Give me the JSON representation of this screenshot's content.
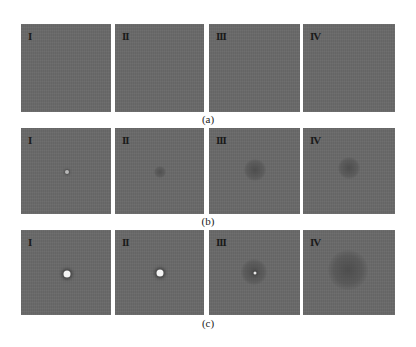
{
  "figure": {
    "rows": [
      {
        "caption": "(a)",
        "panels": [
          {
            "label": "I",
            "feature": "none"
          },
          {
            "label": "II",
            "feature": "none"
          },
          {
            "label": "III",
            "feature": "none"
          },
          {
            "label": "IV",
            "feature": "none"
          }
        ]
      },
      {
        "caption": "(b)",
        "panels": [
          {
            "label": "I",
            "feature": "small-spot"
          },
          {
            "label": "II",
            "feature": "small-cloud"
          },
          {
            "label": "III",
            "feature": "medium-cloud"
          },
          {
            "label": "IV",
            "feature": "medium-cloud"
          }
        ]
      },
      {
        "caption": "(c)",
        "panels": [
          {
            "label": "I",
            "feature": "bright-spot"
          },
          {
            "label": "II",
            "feature": "bright-spot"
          },
          {
            "label": "III",
            "feature": "cloud-with-bright-core"
          },
          {
            "label": "IV",
            "feature": "large-cloud"
          }
        ]
      }
    ],
    "colors": {
      "background": "#ffffff",
      "panel": "#6a6a6a",
      "label": "#1a1a1a"
    }
  }
}
